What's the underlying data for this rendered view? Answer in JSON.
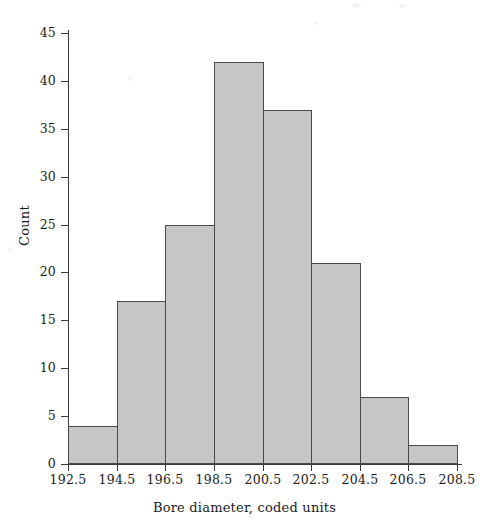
{
  "chart_data": {
    "type": "bar",
    "title": "",
    "xlabel": "Bore diameter, coded units",
    "ylabel": "Count",
    "categories": [
      "192.5-194.5",
      "194.5-196.5",
      "196.5-198.5",
      "198.5-200.5",
      "200.5-202.5",
      "202.5-204.5",
      "204.5-206.5",
      "206.5-208.5"
    ],
    "bin_edges": [
      192.5,
      194.5,
      196.5,
      198.5,
      200.5,
      202.5,
      204.5,
      206.5,
      208.5
    ],
    "bin_width": 2,
    "values": [
      4,
      17,
      25,
      42,
      37,
      21,
      7,
      2
    ],
    "total_count": 155,
    "xlim": [
      192.5,
      208.5
    ],
    "ylim": [
      0,
      45
    ],
    "xticks": [
      "192.5",
      "194.5",
      "196.5",
      "198.5",
      "200.5",
      "202.5",
      "204.5",
      "206.5",
      "208.5"
    ],
    "xtick_values": [
      192.5,
      194.5,
      196.5,
      198.5,
      200.5,
      202.5,
      204.5,
      206.5,
      208.5
    ],
    "yticks": [
      "0",
      "5",
      "10",
      "15",
      "20",
      "25",
      "30",
      "35",
      "40",
      "45"
    ],
    "ytick_values": [
      0,
      5,
      10,
      15,
      20,
      25,
      30,
      35,
      40,
      45
    ],
    "grid": false,
    "legend": null,
    "bar_fill_color": "#c6c6c6",
    "bar_edge_color": "#4a4a4a",
    "axis_color": "#3a3a3a",
    "background_color": "#ffffff"
  }
}
